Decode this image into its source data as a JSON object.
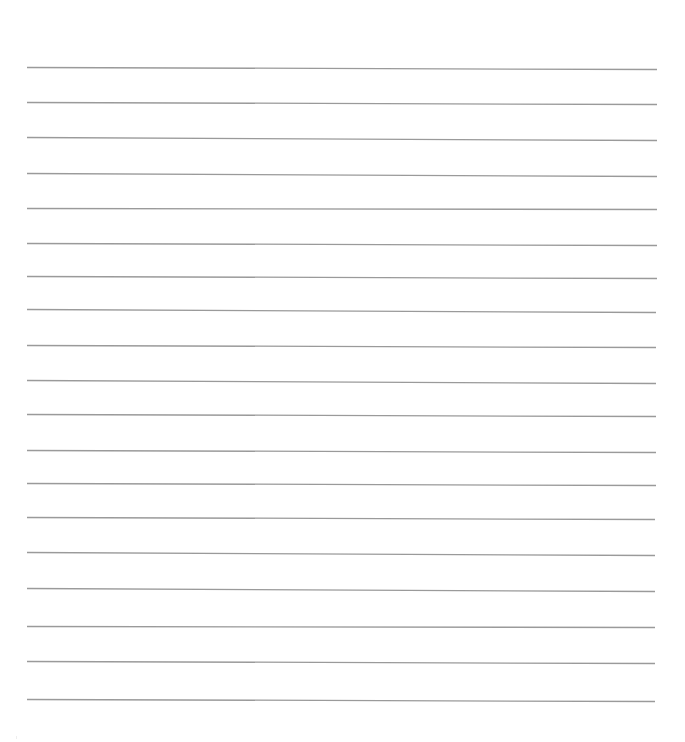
{
  "page": {
    "kind": "blank lined writing sheet",
    "width": 685,
    "height": 742,
    "background_color": "#ffffff"
  },
  "ruling": {
    "line_color": "#9a9a9a",
    "line_width": 1.3,
    "line_count": 19,
    "approx_spacing_px": 35,
    "lines": [
      {
        "x1": 27,
        "y1": 67,
        "x2": 657,
        "y2": 69
      },
      {
        "x1": 27,
        "y1": 102,
        "x2": 657,
        "y2": 104
      },
      {
        "x1": 27,
        "y1": 137,
        "x2": 657,
        "y2": 140
      },
      {
        "x1": 27,
        "y1": 173,
        "x2": 657,
        "y2": 176
      },
      {
        "x1": 27,
        "y1": 208,
        "x2": 657,
        "y2": 209
      },
      {
        "x1": 27,
        "y1": 243,
        "x2": 657,
        "y2": 245
      },
      {
        "x1": 27,
        "y1": 276,
        "x2": 657,
        "y2": 278
      },
      {
        "x1": 27,
        "y1": 309,
        "x2": 656,
        "y2": 312
      },
      {
        "x1": 27,
        "y1": 345,
        "x2": 656,
        "y2": 347
      },
      {
        "x1": 27,
        "y1": 380,
        "x2": 656,
        "y2": 383
      },
      {
        "x1": 27,
        "y1": 414,
        "x2": 656,
        "y2": 416
      },
      {
        "x1": 27,
        "y1": 450,
        "x2": 656,
        "y2": 452
      },
      {
        "x1": 27,
        "y1": 483,
        "x2": 656,
        "y2": 485
      },
      {
        "x1": 27,
        "y1": 517,
        "x2": 655,
        "y2": 519
      },
      {
        "x1": 27,
        "y1": 552,
        "x2": 655,
        "y2": 555
      },
      {
        "x1": 27,
        "y1": 588,
        "x2": 655,
        "y2": 591
      },
      {
        "x1": 27,
        "y1": 626,
        "x2": 655,
        "y2": 627
      },
      {
        "x1": 27,
        "y1": 661,
        "x2": 655,
        "y2": 663
      },
      {
        "x1": 27,
        "y1": 699,
        "x2": 655,
        "y2": 701
      }
    ]
  },
  "marks": [
    {
      "x": 16,
      "y": 736
    }
  ]
}
